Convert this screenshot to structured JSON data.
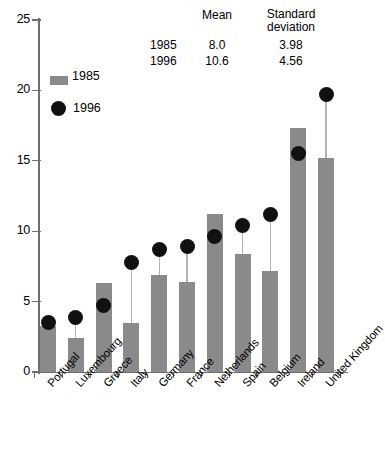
{
  "chart_data": {
    "type": "bar",
    "title": "",
    "xlabel": "",
    "ylabel": "",
    "ylim": [
      0,
      25
    ],
    "yticks": [
      0,
      5,
      10,
      15,
      20,
      25
    ],
    "grid": false,
    "legend_position": "upper-left",
    "categories": [
      "Portugal",
      "Luxembourg",
      "Greece",
      "Italy",
      "Germany",
      "France",
      "Netherlands",
      "Spain",
      "Belgium",
      "Ireland",
      "United Kingdom"
    ],
    "series": [
      {
        "name": "1985",
        "type": "bar",
        "values": [
          3.3,
          2.4,
          6.3,
          3.5,
          6.9,
          6.4,
          11.2,
          8.4,
          7.2,
          17.3,
          15.2
        ]
      },
      {
        "name": "1996",
        "type": "scatter",
        "values": [
          3.5,
          3.9,
          4.7,
          7.8,
          8.7,
          8.9,
          9.6,
          10.4,
          11.2,
          15.5,
          19.7
        ]
      }
    ]
  },
  "stats_table": {
    "header": {
      "mean": "Mean",
      "sd_line1": "Standard",
      "sd_line2": "deviation"
    },
    "rows": [
      {
        "year": "1985",
        "mean": "8.0",
        "sd": "3.98"
      },
      {
        "year": "1996",
        "mean": "10.6",
        "sd": "4.56"
      }
    ]
  },
  "legend": {
    "bar_label": "1985",
    "dot_label": "1996",
    "bar_color": "#8a8a8a",
    "dot_color": "#111111"
  },
  "axis": {
    "tick_labels": [
      "0",
      "5",
      "10",
      "15",
      "20",
      "25"
    ]
  }
}
